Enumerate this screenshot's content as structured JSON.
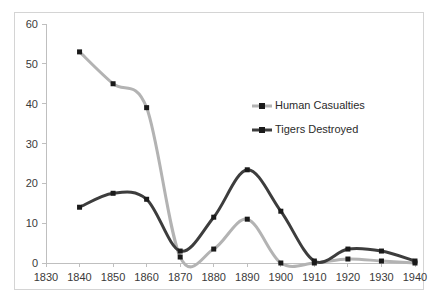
{
  "chart_data": {
    "type": "line",
    "title": "",
    "xlabel": "",
    "ylabel": "",
    "x": [
      1840,
      1850,
      1860,
      1870,
      1880,
      1890,
      1900,
      1910,
      1920,
      1930,
      1940
    ],
    "xlim": [
      1830,
      1940
    ],
    "ylim": [
      0,
      60
    ],
    "x_ticks": [
      "1830",
      "1840",
      "1850",
      "1860",
      "1870",
      "1880",
      "1890",
      "1900",
      "1910",
      "1920",
      "1930",
      "1940"
    ],
    "y_ticks": [
      "0",
      "10",
      "20",
      "30",
      "40",
      "50",
      "60"
    ],
    "grid": false,
    "legend_position": "center-right-inside",
    "smoothing": true,
    "marker": "square",
    "series": [
      {
        "name": "Human Casualties",
        "color": "#b3b3b3",
        "marker_color": "#1a1a1a",
        "values": [
          53,
          45,
          39,
          1.5,
          3.5,
          11,
          0,
          0,
          1,
          0.5,
          0
        ]
      },
      {
        "name": "Tigers Destroyed",
        "color": "#3d3d3d",
        "marker_color": "#1a1a1a",
        "values": [
          14,
          17.5,
          16,
          3,
          11.5,
          23.4,
          13,
          0.5,
          3.5,
          3,
          0.5
        ]
      }
    ]
  },
  "legend": {
    "items": [
      {
        "label": "Human Casualties"
      },
      {
        "label": "Tigers Destroyed"
      }
    ]
  },
  "axes": {
    "y_tick_0": "0",
    "y_tick_1": "10",
    "y_tick_2": "20",
    "y_tick_3": "30",
    "y_tick_4": "40",
    "y_tick_5": "50",
    "y_tick_6": "60",
    "x_tick_0": "1830",
    "x_tick_1": "1840",
    "x_tick_2": "1850",
    "x_tick_3": "1860",
    "x_tick_4": "1870",
    "x_tick_5": "1880",
    "x_tick_6": "1890",
    "x_tick_7": "1900",
    "x_tick_8": "1910",
    "x_tick_9": "1920",
    "x_tick_10": "1930",
    "x_tick_11": "1940"
  }
}
